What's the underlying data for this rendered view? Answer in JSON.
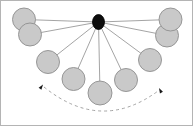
{
  "figure": {
    "canvas": {
      "width": 193,
      "height": 126,
      "background": "#ffffff"
    },
    "frame": {
      "visible": true,
      "color": "#b4b4b4",
      "width": 1
    }
  },
  "colors": {
    "node_fill": "#c9c9c9",
    "node_stroke": "#8f8f8f",
    "hub_fill": "#0d0d0d",
    "hub_stroke": "#000000",
    "spoke": "#9a9a9a",
    "arc": "#9a9a9a",
    "arrow": "#1a1a1a",
    "background": "#ffffff"
  },
  "hub": {
    "label": "pivot-node",
    "cx": 98.5,
    "cy": 22.0,
    "rx": 6.0,
    "ry": 7.5
  },
  "nodes": [
    {
      "id": "node-1",
      "label": "upper-left-outer",
      "cx": 24.0,
      "cy": 19.5,
      "r": 11.5
    },
    {
      "id": "node-2",
      "label": "upper-left-inner",
      "cx": 30.0,
      "cy": 34.5,
      "r": 11.5
    },
    {
      "id": "node-3",
      "label": "mid-left",
      "cx": 48.0,
      "cy": 62.0,
      "r": 11.5
    },
    {
      "id": "node-4",
      "label": "lower-left",
      "cx": 73.5,
      "cy": 79.0,
      "r": 11.5
    },
    {
      "id": "node-5",
      "label": "bottom-center",
      "cx": 100.0,
      "cy": 93.0,
      "r": 12.0
    },
    {
      "id": "node-6",
      "label": "lower-right",
      "cx": 126.0,
      "cy": 80.0,
      "r": 11.5
    },
    {
      "id": "node-7",
      "label": "mid-right",
      "cx": 150.0,
      "cy": 60.0,
      "r": 11.5
    },
    {
      "id": "node-8",
      "label": "upper-right-inner",
      "cx": 167.0,
      "cy": 35.5,
      "r": 11.5
    },
    {
      "id": "node-9",
      "label": "upper-right-outer",
      "cx": 170.5,
      "cy": 19.5,
      "r": 11.5
    }
  ],
  "spokes": [
    {
      "id": "spoke-1",
      "to": "node-1"
    },
    {
      "id": "spoke-2",
      "to": "node-2"
    },
    {
      "id": "spoke-3",
      "to": "node-3"
    },
    {
      "id": "spoke-4",
      "to": "node-4"
    },
    {
      "id": "spoke-5",
      "to": "node-5"
    },
    {
      "id": "spoke-6",
      "to": "node-6"
    },
    {
      "id": "spoke-7",
      "to": "node-7"
    },
    {
      "id": "spoke-8",
      "to": "node-8"
    },
    {
      "id": "spoke-9",
      "to": "node-9"
    }
  ],
  "swing_arc": {
    "label": "double-headed-swing-arc",
    "style": "dashed",
    "dash_pattern": "3 3",
    "start": {
      "x": 44.0,
      "y": 87.0
    },
    "end": {
      "x": 158.0,
      "y": 91.0
    },
    "control": {
      "x": 101.0,
      "y": 133.0
    },
    "arrowheads": [
      {
        "id": "arrowhead-left",
        "x": 43.0,
        "y": 84.5,
        "angle": -55
      },
      {
        "id": "arrowhead-right",
        "x": 159.0,
        "y": 88.0,
        "angle": -118
      }
    ]
  },
  "chart_data": {
    "type": "scatter",
    "xlabel": "",
    "ylabel": "",
    "xlim": [
      0,
      193
    ],
    "ylim": [
      126,
      0
    ],
    "grid": false,
    "legend": null,
    "series": [
      {
        "name": "bob positions",
        "x": [
          24.0,
          30.0,
          48.0,
          73.5,
          100.0,
          126.0,
          150.0,
          167.0,
          170.5
        ],
        "y": [
          19.5,
          34.5,
          62.0,
          79.0,
          93.0,
          80.0,
          60.0,
          35.5,
          19.5
        ]
      },
      {
        "name": "pivot",
        "x": [
          98.5
        ],
        "y": [
          22.0
        ]
      }
    ],
    "annotations": [
      "dashed double-headed arc beneath nodes indicating swing direction"
    ]
  }
}
